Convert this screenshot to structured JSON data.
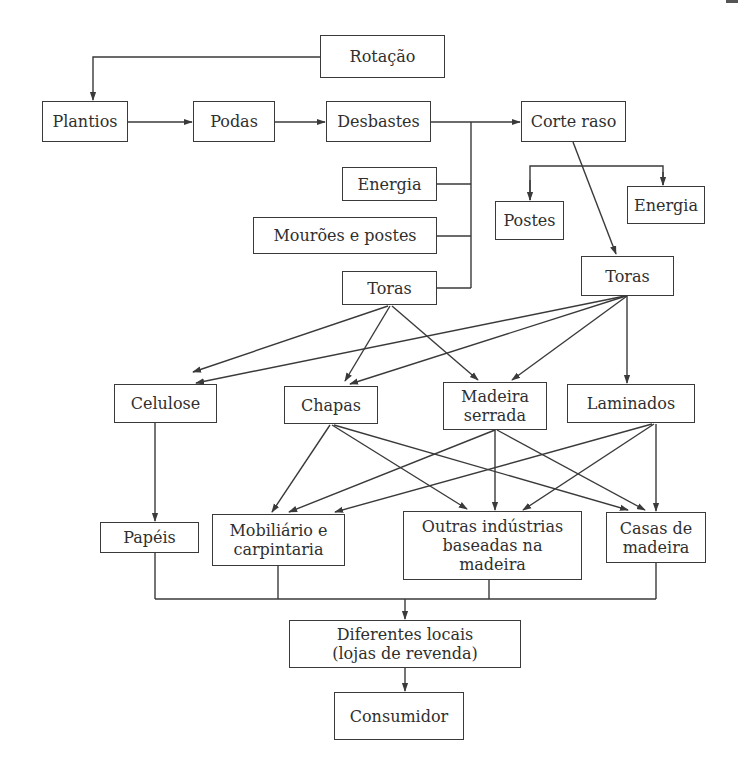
{
  "diagram": {
    "type": "flowchart",
    "language": "pt",
    "line_color": "#3a3a3a",
    "nodes": {
      "rotacao": "Rotação",
      "plantios": "Plantios",
      "podas": "Podas",
      "desbastes": "Desbastes",
      "corte_raso": "Corte raso",
      "energia_desbaste": "Energia",
      "mouroes_postes": "Mourões e postes",
      "toras_desbaste": "Toras",
      "postes": "Postes",
      "energia_corte": "Energia",
      "toras_corte": "Toras",
      "celulose": "Celulose",
      "chapas": "Chapas",
      "madeira_serrada": "Madeira\nserrada",
      "laminados": "Laminados",
      "papeis": "Papéis",
      "mobiliario": "Mobiliário e\ncarpintaria",
      "outras_industrias": "Outras indústrias\nbaseadas na\nmadeira",
      "casas_madeira": "Casas de\nmadeira",
      "diferentes_locais": "Diferentes locais\n(lojas de revenda)",
      "consumidor": "Consumidor"
    },
    "edges": [
      [
        "rotacao",
        "plantios"
      ],
      [
        "plantios",
        "podas"
      ],
      [
        "podas",
        "desbastes"
      ],
      [
        "desbastes",
        "corte_raso"
      ],
      [
        "desbastes",
        "energia_desbaste"
      ],
      [
        "desbastes",
        "mouroes_postes"
      ],
      [
        "desbastes",
        "toras_desbaste"
      ],
      [
        "corte_raso",
        "postes"
      ],
      [
        "corte_raso",
        "energia_corte"
      ],
      [
        "corte_raso",
        "toras_corte"
      ],
      [
        "toras_desbaste",
        "celulose"
      ],
      [
        "toras_desbaste",
        "chapas"
      ],
      [
        "toras_desbaste",
        "madeira_serrada"
      ],
      [
        "toras_corte",
        "celulose"
      ],
      [
        "toras_corte",
        "chapas"
      ],
      [
        "toras_corte",
        "madeira_serrada"
      ],
      [
        "toras_corte",
        "laminados"
      ],
      [
        "celulose",
        "papeis"
      ],
      [
        "chapas",
        "mobiliario"
      ],
      [
        "chapas",
        "outras_industrias"
      ],
      [
        "chapas",
        "casas_madeira"
      ],
      [
        "madeira_serrada",
        "mobiliario"
      ],
      [
        "madeira_serrada",
        "outras_industrias"
      ],
      [
        "madeira_serrada",
        "casas_madeira"
      ],
      [
        "laminados",
        "mobiliario"
      ],
      [
        "laminados",
        "outras_industrias"
      ],
      [
        "laminados",
        "casas_madeira"
      ],
      [
        "papeis",
        "diferentes_locais"
      ],
      [
        "mobiliario",
        "diferentes_locais"
      ],
      [
        "outras_industrias",
        "diferentes_locais"
      ],
      [
        "casas_madeira",
        "diferentes_locais"
      ],
      [
        "diferentes_locais",
        "consumidor"
      ]
    ]
  }
}
